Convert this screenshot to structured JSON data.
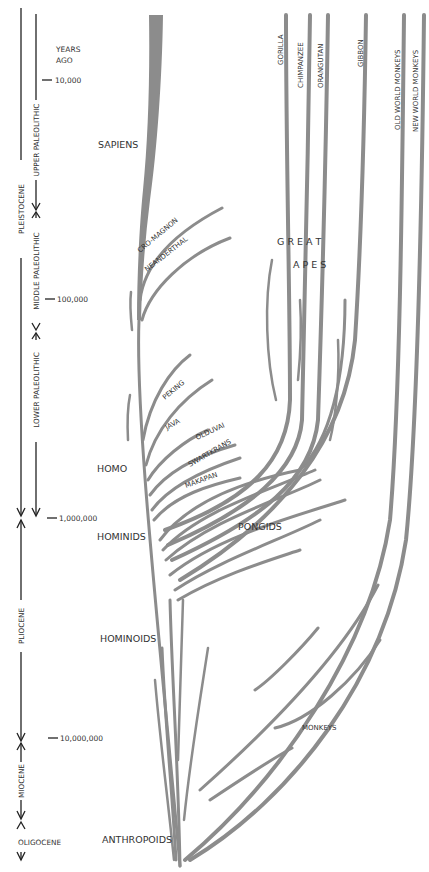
{
  "colors": {
    "branch": "#8c8c8c",
    "text": "#333333",
    "axis": "#222222",
    "background": "#ffffff"
  },
  "time_axis": {
    "header": [
      "YEARS",
      "AGO"
    ],
    "ticks": [
      {
        "label": "10,000",
        "y": 80
      },
      {
        "label": "100,000",
        "y": 270
      },
      {
        "label": "1,000,000",
        "y": 518
      },
      {
        "label": "10,000,000",
        "y": 738
      }
    ]
  },
  "epochs": [
    {
      "label": "PLEISTOCENE",
      "y_start": 8,
      "y_end": 518
    },
    {
      "label": "PLIOCENE",
      "y_start": 520,
      "y_end": 742
    },
    {
      "label": "MIOCENE",
      "y_start": 744,
      "y_end": 818
    },
    {
      "label": "OLIGOCENE"
    }
  ],
  "cultures": [
    {
      "label": "UPPER PALEOLITHIC",
      "y_start": 8,
      "y_end": 210
    },
    {
      "label": "MIDDLE PALEOLITHIC",
      "y_start": 212,
      "y_end": 330
    },
    {
      "label": "LOWER PALEOLITHIC",
      "y_start": 332,
      "y_end": 518
    }
  ],
  "labels": {
    "sapiens": "SAPIENS",
    "cro_magnon": "CRO-MAGNON",
    "neanderthal": "NEANDERTHAL",
    "great": "G R E A T",
    "apes": "A P E S",
    "peking": "PEKING",
    "java": "JAVA",
    "olduvai": "OLDUVAI",
    "swartkrans": "SWARTKRANS",
    "makapan": "MAKAPAN",
    "homo": "HOMO",
    "hominids": "HOMINIDS",
    "pongids": "PONGIDS",
    "hominoids": "HOMINOIDS",
    "monkeys": "MONKEYS",
    "anthropoids": "ANTHROPOIDS"
  },
  "lineages": [
    {
      "label": "GORILLA"
    },
    {
      "label": "CHIMPANZEE"
    },
    {
      "label": "ORANGUTAN"
    },
    {
      "label": "GIBBON"
    },
    {
      "label": "OLD WORLD MONKEYS"
    },
    {
      "label": "NEW WORLD MONKEYS"
    }
  ]
}
